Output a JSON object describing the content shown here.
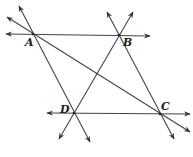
{
  "diagram": {
    "type": "geometry",
    "points": [
      {
        "id": "A",
        "label": "A",
        "x": 33,
        "y": 34,
        "lx": 25,
        "ly": 46
      },
      {
        "id": "B",
        "label": "B",
        "x": 119,
        "y": 35,
        "lx": 123,
        "ly": 46
      },
      {
        "id": "C",
        "label": "C",
        "x": 160,
        "y": 114,
        "lx": 161,
        "ly": 110
      },
      {
        "id": "D",
        "label": "D",
        "x": 74,
        "y": 113,
        "lx": 60,
        "ly": 113
      }
    ],
    "lines": [
      {
        "name": "line-AB",
        "x1": 6,
        "y1": 34,
        "x2": 150,
        "y2": 36,
        "arrow_start": true,
        "arrow_end": true
      },
      {
        "name": "line-DC",
        "x1": 47,
        "y1": 113,
        "x2": 190,
        "y2": 114,
        "arrow_start": true,
        "arrow_end": true
      },
      {
        "name": "line-AD",
        "x1": 19,
        "y1": 6,
        "x2": 90,
        "y2": 142,
        "arrow_start": true,
        "arrow_end": true
      },
      {
        "name": "line-BC",
        "x1": 107,
        "y1": 12,
        "x2": 174,
        "y2": 139,
        "arrow_start": true,
        "arrow_end": true
      },
      {
        "name": "line-BD",
        "x1": 133,
        "y1": 12,
        "x2": 59,
        "y2": 139,
        "arrow_start": true,
        "arrow_end": true
      },
      {
        "name": "line-AC",
        "x1": 7,
        "y1": 17,
        "x2": 190,
        "y2": 132,
        "arrow_start": true,
        "arrow_end": true
      }
    ],
    "colors": {
      "stroke": "#444444",
      "label": "#222222",
      "background": "#ffffff"
    }
  }
}
